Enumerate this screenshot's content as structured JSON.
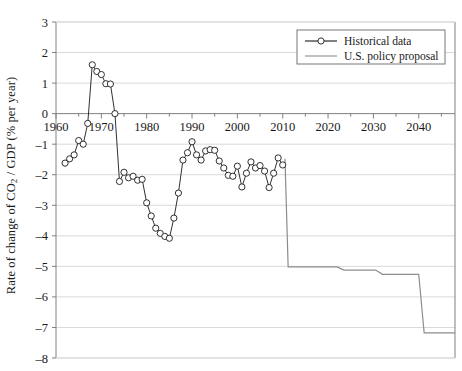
{
  "chart_data": {
    "type": "line",
    "title": "",
    "xlabel": "",
    "ylabel": "Rate of change of CO2 / GDP (% per year)",
    "ylabel_parts": {
      "pre": "Rate of change of CO",
      "sub": "2",
      "post": " / GDP (% per year)"
    },
    "xlim": [
      1960,
      2048
    ],
    "ylim": [
      -8,
      3
    ],
    "ytick_labels": [
      "3",
      "2",
      "1",
      "0",
      "-1",
      "-2",
      "-3",
      "-4",
      "-5",
      "-6",
      "-7",
      "-8"
    ],
    "ytick_values": [
      3,
      2,
      1,
      0,
      -1,
      -2,
      -3,
      -4,
      -5,
      -6,
      -7,
      -8
    ],
    "xtick_labels": [
      "1960",
      "1970",
      "1980",
      "1990",
      "2000",
      "2010",
      "2020",
      "2030",
      "2040"
    ],
    "xtick_values": [
      1960,
      1970,
      1980,
      1990,
      2000,
      2010,
      2020,
      2030,
      2040
    ],
    "xminor_values": [
      1965,
      1975,
      1985,
      1995,
      2005,
      2015,
      2025,
      2035,
      2045
    ],
    "grid": "horizontal",
    "legend_position": "top-right",
    "colors": {
      "historical": "#1a1a1a",
      "policy": "#8c8c8c",
      "grid": "#d9d9d9",
      "axis": "#808080",
      "marker_fill": "#ffffff"
    },
    "series": [
      {
        "name": "Historical data",
        "style": "line-markers",
        "marker": "circle-open",
        "color": "#1a1a1a",
        "points": [
          [
            1962,
            -1.62
          ],
          [
            1963,
            -1.48
          ],
          [
            1964,
            -1.35
          ],
          [
            1965,
            -0.88
          ],
          [
            1966,
            -1.0
          ],
          [
            1967,
            -0.32
          ],
          [
            1968,
            1.6
          ],
          [
            1969,
            1.38
          ],
          [
            1970,
            1.28
          ],
          [
            1971,
            0.98
          ],
          [
            1972,
            0.97
          ],
          [
            1973,
            0.0
          ],
          [
            1974,
            -2.22
          ],
          [
            1975,
            -1.92
          ],
          [
            1976,
            -2.1
          ],
          [
            1977,
            -2.05
          ],
          [
            1978,
            -2.18
          ],
          [
            1979,
            -2.15
          ],
          [
            1980,
            -2.92
          ],
          [
            1981,
            -3.35
          ],
          [
            1982,
            -3.75
          ],
          [
            1983,
            -3.92
          ],
          [
            1984,
            -4.02
          ],
          [
            1985,
            -4.08
          ],
          [
            1986,
            -3.42
          ],
          [
            1987,
            -2.6
          ],
          [
            1988,
            -1.52
          ],
          [
            1989,
            -1.28
          ],
          [
            1990,
            -0.92
          ],
          [
            1991,
            -1.35
          ],
          [
            1992,
            -1.52
          ],
          [
            1993,
            -1.22
          ],
          [
            1994,
            -1.18
          ],
          [
            1995,
            -1.2
          ],
          [
            1996,
            -1.55
          ],
          [
            1997,
            -1.78
          ],
          [
            1998,
            -2.02
          ],
          [
            1999,
            -2.05
          ],
          [
            2000,
            -1.72
          ],
          [
            2001,
            -2.4
          ],
          [
            2002,
            -1.95
          ],
          [
            2003,
            -1.58
          ],
          [
            2004,
            -1.78
          ],
          [
            2005,
            -1.7
          ],
          [
            2006,
            -1.88
          ],
          [
            2007,
            -2.42
          ],
          [
            2008,
            -1.95
          ],
          [
            2009,
            -1.45
          ],
          [
            2010,
            -1.68
          ]
        ]
      },
      {
        "name": "U.S. policy proposal",
        "style": "step-line",
        "marker": "none",
        "color": "#8c8c8c",
        "points": [
          [
            2010.5,
            -1.48
          ],
          [
            2011.2,
            -5.02
          ],
          [
            2022.0,
            -5.02
          ],
          [
            2023.5,
            -5.12
          ],
          [
            2030.5,
            -5.12
          ],
          [
            2032.0,
            -5.26
          ],
          [
            2040.0,
            -5.26
          ],
          [
            2041.2,
            -7.18
          ],
          [
            2048.0,
            -7.18
          ]
        ]
      }
    ]
  },
  "legend": {
    "entries": [
      {
        "label": "Historical data",
        "marker": "circle-open",
        "color": "#1a1a1a"
      },
      {
        "label": "U.S. policy proposal",
        "marker": "none",
        "color": "#8c8c8c"
      }
    ]
  }
}
